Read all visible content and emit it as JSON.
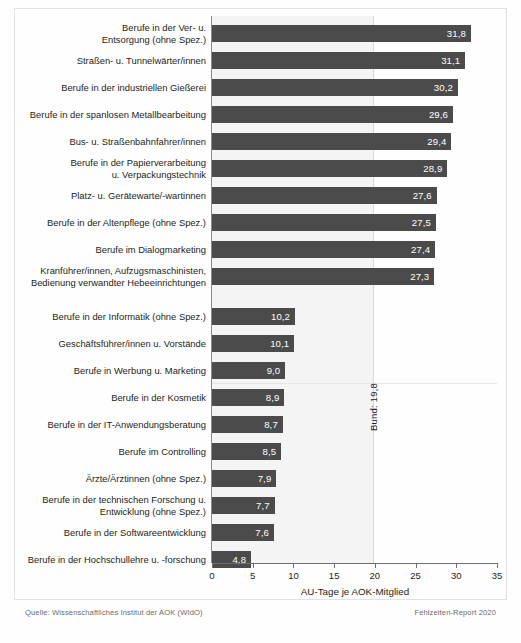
{
  "chart_data": {
    "type": "bar",
    "orientation": "horizontal",
    "title": "",
    "xlabel": "AU-Tage je AOK-Mitglied",
    "ylabel": "",
    "xlim": [
      0,
      35
    ],
    "xticks": [
      "0",
      "5",
      "10",
      "15",
      "20",
      "25",
      "30",
      "35"
    ],
    "grid": false,
    "legend": "none",
    "reference_line": {
      "label": "Bund: 19,8",
      "value": 19.8
    },
    "categories": [
      "Berufe in der Ver- u.\nEntsorgung (ohne Spez.)",
      "Straßen- u. Tunnelwärter/innen",
      "Berufe in der industriellen Gießerei",
      "Berufe in der spanlosen Metallbearbeitung",
      "Bus- u. Straßenbahnfahrer/innen",
      "Berufe in der Papierverarbeitung\nu. Verpackungstechnik",
      "Platz- u. Gerätewarte/-wartinnen",
      "Berufe in der Altenpflege (ohne Spez.)",
      "Berufe im Dialogmarketing",
      "Kranführer/innen, Aufzugsmaschinisten,\nBedienung verwandter Hebeeinrichtungen",
      "Berufe in der Informatik (ohne Spez.)",
      "Geschäftsführer/innen u. Vorstände",
      "Berufe in Werbung u. Marketing",
      "Berufe in der Kosmetik",
      "Berufe in der IT-Anwendungsberatung",
      "Berufe im Controlling",
      "Ärzte/Ärztinnen (ohne Spez.)",
      "Berufe in der technischen Forschung u.\nEntwicklung (ohne Spez.)",
      "Berufe in der Softwareentwicklung",
      "Berufe in der Hochschullehre u. -forschung"
    ],
    "values": [
      31.8,
      31.1,
      30.2,
      29.6,
      29.4,
      28.9,
      27.6,
      27.5,
      27.4,
      27.3,
      10.2,
      10.1,
      9.0,
      8.9,
      8.7,
      8.5,
      7.9,
      7.7,
      7.6,
      4.8
    ],
    "value_labels": [
      "31,8",
      "31,1",
      "30,2",
      "29,6",
      "29,4",
      "28,9",
      "27,6",
      "27,5",
      "27,4",
      "27,3",
      "10,2",
      "10,1",
      "9,0",
      "8,9",
      "8,7",
      "8,5",
      "7,9",
      "7,7",
      "7,6",
      "4,8"
    ],
    "bar_color": "#4b4b4b",
    "value_label_color": "#ffffff"
  },
  "footer": {
    "source": "Quelle: Wissenschaftliches Institut der AOK (WIdO)",
    "report": "Fehlzeiten-Report 2020"
  }
}
